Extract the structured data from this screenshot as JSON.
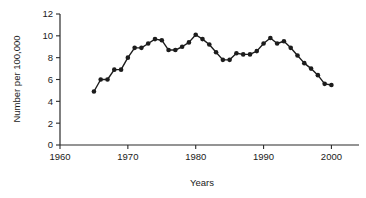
{
  "chart_data": {
    "type": "line",
    "title": "",
    "xlabel": "Years",
    "ylabel": "Number per 100,000",
    "xlim": [
      1960,
      2002
    ],
    "ylim": [
      0,
      12
    ],
    "xticks": [
      1960,
      1970,
      1980,
      1990,
      2000
    ],
    "xtick_labels": [
      "1960",
      "1970",
      "1980",
      "1990",
      "2000"
    ],
    "yticks": [
      0,
      2,
      4,
      6,
      8,
      10,
      12
    ],
    "ytick_labels": [
      "0",
      "2",
      "4",
      "6",
      "8",
      "10",
      "12"
    ],
    "grid": false,
    "legend": null,
    "marker": "filled-circle",
    "line_color": "#1c1c1c",
    "x": [
      1965,
      1966,
      1967,
      1968,
      1969,
      1970,
      1971,
      1972,
      1973,
      1974,
      1975,
      1976,
      1977,
      1978,
      1979,
      1980,
      1981,
      1982,
      1983,
      1984,
      1985,
      1986,
      1987,
      1988,
      1989,
      1990,
      1991,
      1992,
      1993,
      1994,
      1995,
      1996,
      1997,
      1998,
      1999,
      2000
    ],
    "values": [
      4.9,
      6.0,
      6.0,
      6.9,
      6.9,
      8.0,
      8.9,
      8.9,
      9.3,
      9.7,
      9.6,
      8.7,
      8.7,
      9.0,
      9.4,
      10.1,
      9.7,
      9.2,
      8.5,
      7.8,
      7.8,
      8.4,
      8.3,
      8.3,
      8.6,
      9.3,
      9.8,
      9.3,
      9.5,
      8.9,
      8.2,
      7.5,
      7.0,
      6.4,
      5.6,
      5.5
    ],
    "series": [
      {
        "name": "Number per 100,000",
        "values": [
          4.9,
          6.0,
          6.0,
          6.9,
          6.9,
          8.0,
          8.9,
          8.9,
          9.3,
          9.7,
          9.6,
          8.7,
          8.7,
          9.0,
          9.4,
          10.1,
          9.7,
          9.2,
          8.5,
          7.8,
          7.8,
          8.4,
          8.3,
          8.3,
          8.6,
          9.3,
          9.8,
          9.3,
          9.5,
          8.9,
          8.2,
          7.5,
          7.0,
          6.4,
          5.6,
          5.5
        ]
      }
    ]
  }
}
